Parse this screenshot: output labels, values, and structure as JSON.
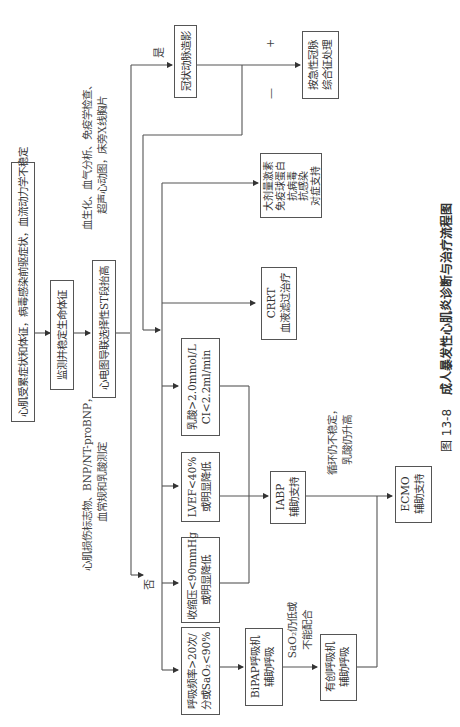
{
  "figure": {
    "number": "图 13-8",
    "title": "成人暴发性心肌炎诊断与治疗流程图",
    "orientation": "rotated-90-ccw"
  },
  "nodes": {
    "symptoms": "心肌受累症状和体征，病毒感染前驱症状，血流动力学不稳定",
    "monitor": "监测并稳定生命体征",
    "ecg": "心电图导联选择性ST段抬高",
    "coronary": "冠状动脉造影",
    "acs": [
      "按急性冠脉",
      "综合征处理"
    ],
    "drugs": [
      "大剂量激素",
      "免疫球蛋白",
      "抗病毒",
      "抗感染",
      "对症支持"
    ],
    "crrt": [
      "CRRT",
      "血液滤过治疗"
    ],
    "lactate": [
      "乳酸>2.0mmol/L",
      "CI<2.2ml/min"
    ],
    "lvef": [
      "LVEF<40%",
      "或明显降低"
    ],
    "sbp": [
      "收缩压<90mmHg",
      "或明显降低"
    ],
    "resp": [
      "呼吸频率>20次/",
      "分或SaO₂<90%"
    ],
    "iabp": [
      "IABP",
      "辅助支持"
    ],
    "bipap": [
      "BiPAP呼吸机",
      "辅助呼吸"
    ],
    "invasive": [
      "有创呼吸机",
      "辅助呼吸"
    ],
    "ecmo": [
      "ECMO",
      "辅助支持"
    ]
  },
  "notes": {
    "labs_top": [
      "血生化、血气分析、免疫学检查、",
      "超声心动图，床旁X线胸片"
    ],
    "labs_bottom": [
      "心肌损伤标志物、BNP/NT-proBNP，",
      "血常规和乳酸测定"
    ],
    "sao2_note": [
      "SaO₂仍低或",
      "不能配合"
    ],
    "circ_note": [
      "循环仍不稳定，",
      "乳酸仍升高"
    ]
  },
  "labels": {
    "yes": "是",
    "no": "否",
    "plus": "+",
    "minus": "—"
  }
}
